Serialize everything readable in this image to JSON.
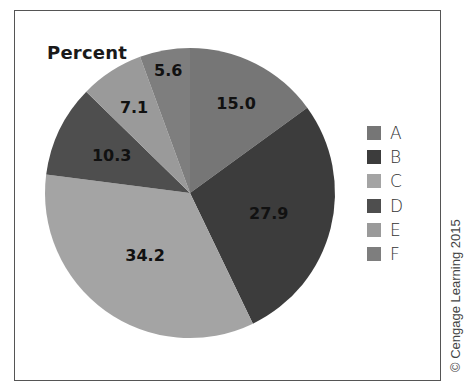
{
  "chart_data": {
    "type": "pie",
    "title": "Percent",
    "categories": [
      "A",
      "B",
      "C",
      "D",
      "E",
      "F"
    ],
    "values": [
      15.0,
      27.9,
      34.2,
      10.3,
      7.1,
      5.6
    ],
    "labels": [
      "15.0",
      "27.9",
      "34.2",
      "10.3",
      "7.1",
      "5.6"
    ],
    "colors": [
      "#767676",
      "#3c3c3c",
      "#a4a4a4",
      "#4e4e4e",
      "#9a9a9a",
      "#7e7e7e"
    ],
    "start_angle_deg": 0,
    "direction": "clockwise",
    "legend_position": "right",
    "units": "percent"
  },
  "title": "Percent",
  "legend": {
    "items": [
      {
        "label": "A",
        "color": "#767676"
      },
      {
        "label": "B",
        "color": "#3c3c3c"
      },
      {
        "label": "C",
        "color": "#a4a4a4"
      },
      {
        "label": "D",
        "color": "#4e4e4e"
      },
      {
        "label": "E",
        "color": "#9a9a9a"
      },
      {
        "label": "F",
        "color": "#7e7e7e"
      }
    ]
  },
  "copyright": "© Cengage Learning 2015"
}
